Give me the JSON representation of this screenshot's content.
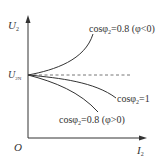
{
  "diagram": {
    "type": "voltage-regulation-characteristic",
    "y_axis": {
      "symbol": "U",
      "subscript": "2"
    },
    "x_axis": {
      "symbol": "I",
      "subscript": "2"
    },
    "origin_label": "O",
    "reference_level": {
      "symbol": "U",
      "subscript": "2N",
      "style": "dashed"
    },
    "curves": [
      {
        "id": "capacitive",
        "label_prefix": "cosφ",
        "label_sub": "2",
        "label_rest": "=0.8 (φ<0)",
        "trend": "rising"
      },
      {
        "id": "resistive",
        "label_prefix": "cosφ",
        "label_sub": "2",
        "label_rest": "=1",
        "trend": "slightly-falling"
      },
      {
        "id": "inductive",
        "label_prefix": "cosφ",
        "label_sub": "2",
        "label_rest": "=0.8 (φ>0)",
        "trend": "falling"
      }
    ],
    "colors": {
      "line": "#333333",
      "dashed": "#666666",
      "background": "#ffffff"
    }
  }
}
